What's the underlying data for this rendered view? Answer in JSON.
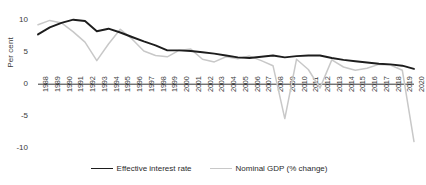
{
  "chart_data": {
    "type": "line",
    "title": "",
    "xlabel": "",
    "ylabel": "Per cent",
    "ylim": [
      -10,
      11
    ],
    "yticks": [
      10,
      5,
      0,
      -5,
      -10
    ],
    "ytick_labels": [
      "10",
      "5",
      "0",
      "-5",
      "-10"
    ],
    "grid": false,
    "legend_position": "bottom",
    "categories": [
      "1988",
      "1989",
      "1990",
      "1991",
      "1992",
      "1993",
      "1994",
      "1995",
      "1996",
      "1997",
      "1998",
      "1999",
      "2000",
      "2001",
      "2002",
      "2003",
      "2004",
      "2005",
      "2006",
      "2007",
      "2008",
      "2009",
      "2010",
      "2011",
      "2012",
      "2013",
      "2014",
      "2015",
      "2016",
      "2017",
      "2018",
      "2019",
      "2020"
    ],
    "series": [
      {
        "name": "Effective interest rate",
        "color": "#1d1d1d",
        "values": [
          7.8,
          8.9,
          9.6,
          10.1,
          9.9,
          8.3,
          8.7,
          8.1,
          7.4,
          6.7,
          6.1,
          5.3,
          5.3,
          5.2,
          5.0,
          4.8,
          4.5,
          4.2,
          4.1,
          4.3,
          4.5,
          4.2,
          4.4,
          4.5,
          4.5,
          4.1,
          3.8,
          3.6,
          3.4,
          3.2,
          3.1,
          2.9,
          2.4
        ]
      },
      {
        "name": "Nominal GDP (% change)",
        "color": "#c8c8c8",
        "values": [
          9.3,
          10.0,
          9.6,
          8.2,
          6.6,
          3.7,
          6.3,
          8.6,
          7.1,
          5.2,
          4.5,
          4.3,
          5.3,
          5.5,
          3.9,
          3.5,
          4.3,
          4.0,
          4.4,
          3.7,
          2.9,
          -5.4,
          3.9,
          2.3,
          -0.6,
          3.8,
          2.7,
          2.2,
          2.5,
          3.1,
          3.0,
          2.2,
          -9.0
        ]
      }
    ]
  },
  "legend": {
    "items": [
      {
        "label": "Effective interest rate",
        "style": "solid-dark"
      },
      {
        "label": "Nominal GDP (% change)",
        "style": "solid-light"
      }
    ]
  },
  "icons": {
    "dark_line_swatch": "line-swatch-dark-icon",
    "light_line_swatch": "line-swatch-light-icon"
  }
}
